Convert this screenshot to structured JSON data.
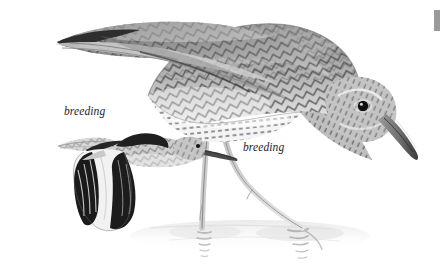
{
  "plate": {
    "background_color": "#ffffff",
    "ink_color": "#2b2b2b",
    "subjects": [
      {
        "id": "standing-bird",
        "name": "wading shorebird, standing in shallow water, head lowered, long slightly decurved bill",
        "plumage": "breeding",
        "posture": "standing / feeding",
        "features": [
          "long dark bill",
          "dark eye",
          "barred flanks",
          "chevron-patterned upperparts",
          "long pale legs",
          "water reflection"
        ]
      },
      {
        "id": "flying-bird",
        "name": "shorebird in flight, showing bold black-and-white wing pattern",
        "plumage": "breeding",
        "posture": "flight",
        "features": [
          "black primaries",
          "white wing stripe",
          "straight bill",
          "mottled back"
        ]
      }
    ]
  },
  "labels": {
    "flight_label": "breeding",
    "standing_label": "breeding"
  },
  "edge_marker": {
    "color": "#9a9a9a"
  }
}
